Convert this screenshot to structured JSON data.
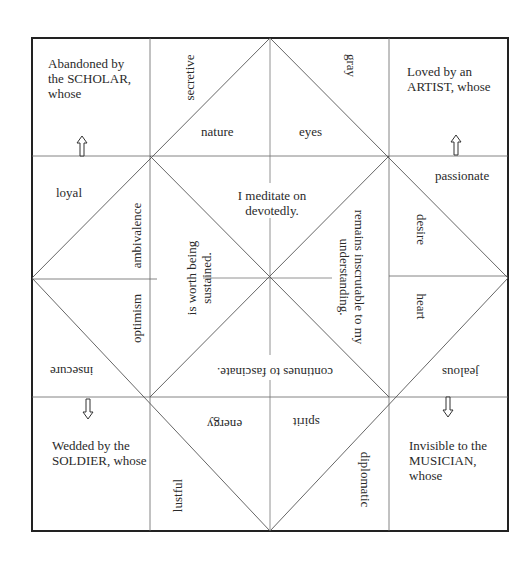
{
  "colors": {
    "line": "#555555",
    "border": "#222222",
    "text": "#2a2a2a",
    "background": "#ffffff"
  },
  "corners": {
    "top_left": "Abandoned by the SCHOLAR, whose",
    "top_right": "Loved by an ARTIST, whose",
    "bottom_left": "Wedded by the SOLDIER, whose",
    "bottom_right": "Invisible to the MUSICIAN, whose"
  },
  "corner_arrows": {
    "top_left": "up-arrow",
    "top_right": "up-arrow",
    "bottom_left": "down-arrow",
    "bottom_right": "down-arrow"
  },
  "outer_words": {
    "secretive": "secretive",
    "gray": "gray",
    "nature": "nature",
    "eyes": "eyes",
    "loyal": "loyal",
    "passionate": "passionate",
    "ambivalence": "ambivalence",
    "optimism": "optimism",
    "desire": "desire",
    "heart": "heart",
    "insecure": "insecure",
    "jealous": "jealous",
    "energy": "energy",
    "spirit": "spirit",
    "lustful": "lustful",
    "diplomatic": "diplomatic"
  },
  "center_phrases": {
    "top": "I meditate on devotedly.",
    "left": "is worth being sustained.",
    "right": "remains inscrutable to my understanding.",
    "bottom": "continues to fascinate."
  }
}
